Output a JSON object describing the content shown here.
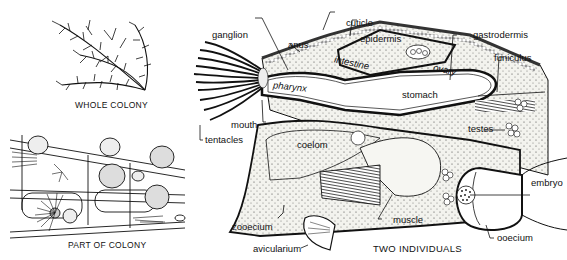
{
  "figure": {
    "panels": [
      {
        "id": "whole-colony",
        "caption": "WHOLE COLONY"
      },
      {
        "id": "part-of-colony",
        "caption": "PART OF COLONY"
      },
      {
        "id": "two-individuals",
        "caption": "TWO INDIVIDUALS"
      }
    ],
    "labels": {
      "cuticle": "cuticle",
      "ganglion": "ganglion",
      "anus": "anus",
      "epidermis": "epidermis",
      "gastrodermis": "gastrodermis",
      "funiculus": "funiculus",
      "intestine": "intestine",
      "ovary": "ovary",
      "pharynx": "pharynx",
      "stomach": "stomach",
      "mouth": "mouth",
      "tentacles": "tentacles",
      "testes": "testes",
      "coelom": "coelom",
      "embryo": "embryo",
      "zooecium": "zooecium",
      "muscle": "muscle",
      "avicularium": "avicularium",
      "ooecium": "ooecium"
    },
    "colors": {
      "ink": "#111111",
      "stipple": "#e9e9e2",
      "background": "#ffffff"
    }
  }
}
